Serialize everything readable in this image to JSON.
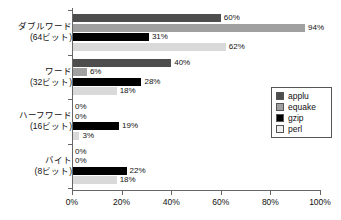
{
  "chart_data": {
    "type": "bar",
    "orientation": "horizontal",
    "title": "",
    "xlabel": "",
    "ylabel": "",
    "xlim": [
      0,
      100
    ],
    "grid": false,
    "legend_position": "center-right",
    "categories": [
      "ダブルワード\n(64ビット)",
      "ワード\n(32ビット)",
      "ハーフワード\n(16ビット)",
      "バイト\n(8ビット)"
    ],
    "category_lines": [
      {
        "line1": "ダブルワード",
        "line2": "(64ビット)"
      },
      {
        "line1": "ワード",
        "line2": "(32ビット)"
      },
      {
        "line1": "ハーフワード",
        "line2": "(16ビット)"
      },
      {
        "line1": "バイト",
        "line2": "(8ビット)"
      }
    ],
    "series": [
      {
        "name": "applu",
        "color": "#4d4d4d",
        "values": [
          60,
          40,
          0,
          0
        ],
        "labels": [
          "60%",
          "40%",
          "0%",
          "0%"
        ]
      },
      {
        "name": "equake",
        "color": "#a0a0a0",
        "values": [
          94,
          6,
          0,
          0
        ],
        "labels": [
          "94%",
          "6%",
          "0%",
          "0%"
        ]
      },
      {
        "name": "gzip",
        "color": "#000000",
        "values": [
          31,
          28,
          19,
          22
        ],
        "labels": [
          "31%",
          "28%",
          "19%",
          "22%"
        ]
      },
      {
        "name": "perl",
        "color": "#d9d9d9",
        "values": [
          62,
          18,
          3,
          18
        ],
        "labels": [
          "62%",
          "18%",
          "3%",
          "18%"
        ]
      }
    ],
    "xticks": [
      0,
      20,
      40,
      60,
      80,
      100
    ],
    "xtick_labels": [
      "0%",
      "20%",
      "40%",
      "60%",
      "80%",
      "100%"
    ]
  },
  "legend": {
    "items": [
      {
        "label": "applu",
        "color": "#4d4d4d"
      },
      {
        "label": "equake",
        "color": "#a0a0a0"
      },
      {
        "label": "gzip",
        "color": "#000000"
      },
      {
        "label": "perl",
        "color": "#eeeeee"
      }
    ]
  },
  "colors": {
    "axis": "#666666",
    "text": "#111111",
    "background": "#ffffff"
  }
}
